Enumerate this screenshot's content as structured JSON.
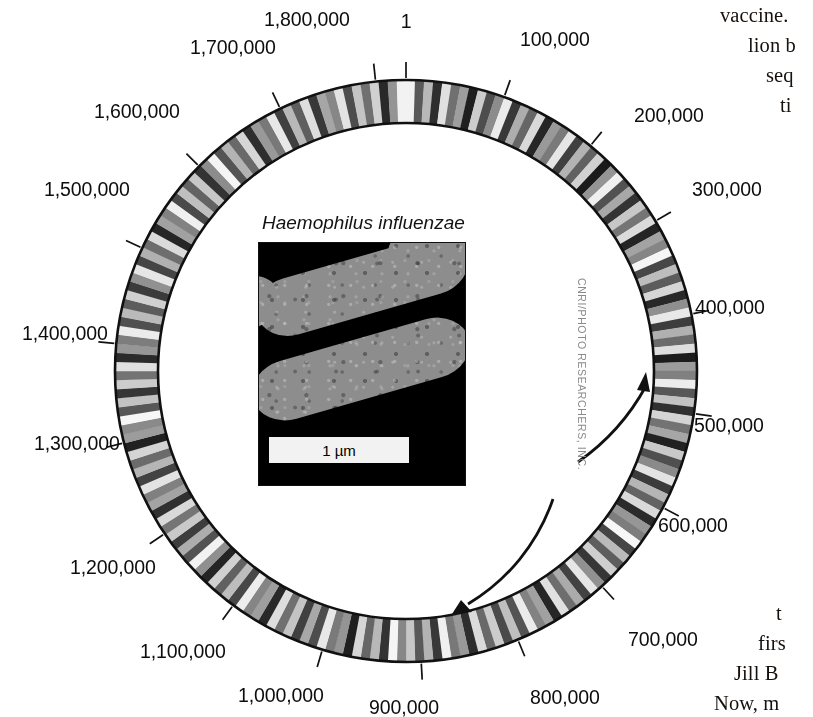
{
  "figure": {
    "kind": "circular-genome-map",
    "organism_label": "Haemophilus influenzae",
    "scale_bar_label": "1 µm",
    "photo_credit": "CNRI/PHOTO RESEARCHERS, INC.",
    "genome_length_bp": 1830000,
    "ring": {
      "outer_radius": 291,
      "inner_radius": 248,
      "center_x": 406,
      "center_y": 371,
      "stroke": "#111111",
      "band_colors": [
        "#ffffff",
        "#d8d8d8",
        "#b4b4b4",
        "#8e8e8e",
        "#6a6a6a",
        "#4a4a4a"
      ]
    },
    "arrows": {
      "outer_label": "replication-direction-clockwise",
      "inner_label": "replication-direction-counterclockwise",
      "color": "#111111"
    }
  },
  "ticks": [
    {
      "value": "1",
      "angle_deg": 0,
      "x": 406,
      "y": 10,
      "align": "center",
      "leader": "vertical"
    },
    {
      "value": "100,000",
      "angle_deg": 19.7,
      "x": 520,
      "y": 28,
      "align": "left",
      "leader": "diagonal"
    },
    {
      "value": "200,000",
      "angle_deg": 39.3,
      "x": 634,
      "y": 104,
      "align": "left",
      "leader": "diagonal"
    },
    {
      "value": "300,000",
      "angle_deg": 59,
      "x": 692,
      "y": 178,
      "align": "left",
      "leader": "diagonal"
    },
    {
      "value": "400,000",
      "angle_deg": 78.7,
      "x": 695,
      "y": 296,
      "align": "left",
      "leader": "diagonal"
    },
    {
      "value": "500,000",
      "angle_deg": 98.4,
      "x": 694,
      "y": 414,
      "align": "left",
      "leader": "diagonal"
    },
    {
      "value": "600,000",
      "angle_deg": 118,
      "x": 658,
      "y": 514,
      "align": "left",
      "leader": "diagonal"
    },
    {
      "value": "700,000",
      "angle_deg": 137.7,
      "x": 628,
      "y": 628,
      "align": "left",
      "leader": "diagonal"
    },
    {
      "value": "800,000",
      "angle_deg": 157.4,
      "x": 530,
      "y": 686,
      "align": "left",
      "leader": "diagonal"
    },
    {
      "value": "900,000",
      "angle_deg": 177,
      "x": 404,
      "y": 696,
      "align": "center",
      "leader": "vertical"
    },
    {
      "value": "1,000,000",
      "angle_deg": 196.7,
      "x": 238,
      "y": 684,
      "align": "left",
      "leader": "diagonal"
    },
    {
      "value": "1,100,000",
      "angle_deg": 216.4,
      "x": 140,
      "y": 640,
      "align": "left",
      "leader": "diagonal"
    },
    {
      "value": "1,200,000",
      "angle_deg": 236,
      "x": 70,
      "y": 556,
      "align": "left",
      "leader": "diagonal"
    },
    {
      "value": "1,300,000",
      "angle_deg": 255.7,
      "x": 34,
      "y": 432,
      "align": "left",
      "leader": "diagonal"
    },
    {
      "value": "1,400,000",
      "angle_deg": 275.4,
      "x": 22,
      "y": 322,
      "align": "left",
      "leader": "diagonal"
    },
    {
      "value": "1,500,000",
      "angle_deg": 295,
      "x": 44,
      "y": 178,
      "align": "left",
      "leader": "diagonal"
    },
    {
      "value": "1,600,000",
      "angle_deg": 314.7,
      "x": 94,
      "y": 100,
      "align": "left",
      "leader": "diagonal"
    },
    {
      "value": "1,700,000",
      "angle_deg": 334.4,
      "x": 190,
      "y": 36,
      "align": "left",
      "leader": "diagonal"
    },
    {
      "value": "1,800,000",
      "angle_deg": 354,
      "x": 264,
      "y": 8,
      "align": "left",
      "leader": "vertical"
    }
  ],
  "surrounding_text": {
    "top_right": [
      {
        "text": "vaccine.",
        "x": 720,
        "y": 4
      },
      {
        "text": "lion b",
        "x": 748,
        "y": 34
      },
      {
        "text": "seq",
        "x": 766,
        "y": 64
      },
      {
        "text": "ti",
        "x": 780,
        "y": 94
      }
    ],
    "bottom_right": [
      {
        "text": "t",
        "x": 776,
        "y": 602
      },
      {
        "text": "firs",
        "x": 758,
        "y": 632
      },
      {
        "text": "Jill B",
        "x": 734,
        "y": 662
      },
      {
        "text": "Now, m",
        "x": 714,
        "y": 692
      }
    ]
  },
  "chart_data": {
    "type": "circular-ideogram",
    "units": "base pairs",
    "axis_range": [
      1,
      1830000
    ],
    "tick_interval": 100000,
    "tick_labels": [
      "1",
      "100,000",
      "200,000",
      "300,000",
      "400,000",
      "500,000",
      "600,000",
      "700,000",
      "800,000",
      "900,000",
      "1,000,000",
      "1,100,000",
      "1,200,000",
      "1,300,000",
      "1,400,000",
      "1,500,000",
      "1,600,000",
      "1,700,000",
      "1,800,000"
    ],
    "grid": false,
    "legend": "none",
    "band_intensities": [
      0.95,
      0.35,
      0.72,
      0.18,
      0.88,
      0.44,
      0.62,
      0.12,
      0.8,
      0.3,
      0.55,
      0.92,
      0.22,
      0.68,
      0.4,
      0.85,
      0.15,
      0.6,
      0.48,
      0.9,
      0.25,
      0.7,
      0.38,
      0.82,
      0.1,
      0.58,
      0.94,
      0.32,
      0.66,
      0.2,
      0.78,
      0.46,
      0.86,
      0.14,
      0.64,
      0.52,
      0.96,
      0.28,
      0.74,
      0.36,
      0.84,
      0.16,
      0.56,
      0.91,
      0.24,
      0.69,
      0.42,
      0.87,
      0.11,
      0.61,
      0.5,
      0.93,
      0.34,
      0.76,
      0.19,
      0.83,
      0.45,
      0.65,
      0.13,
      0.79,
      0.31,
      0.54,
      0.89,
      0.23,
      0.71,
      0.39,
      0.85,
      0.17,
      0.59,
      0.49,
      0.97,
      0.27,
      0.73,
      0.37,
      0.81,
      0.21,
      0.57,
      0.9,
      0.26,
      0.67,
      0.43,
      0.88,
      0.15,
      0.63,
      0.51,
      0.92,
      0.33,
      0.75,
      0.29,
      0.8,
      0.41,
      0.86,
      0.18,
      0.6,
      0.47,
      0.94,
      0.22,
      0.7,
      0.35,
      0.78,
      0.53,
      0.96,
      0.2,
      0.72,
      0.4,
      0.84,
      0.12,
      0.58,
      0.48,
      0.91,
      0.3,
      0.66,
      0.25,
      0.77,
      0.44,
      0.87,
      0.16,
      0.62,
      0.52,
      0.93,
      0.28,
      0.74,
      0.38,
      0.82,
      0.14,
      0.56,
      0.95,
      0.32,
      0.68,
      0.24,
      0.79,
      0.46,
      0.85,
      0.19,
      0.64,
      0.5,
      0.89,
      0.26,
      0.71,
      0.42,
      0.83,
      0.13,
      0.61,
      0.54,
      0.97,
      0.34,
      0.76,
      0.21,
      0.8,
      0.45,
      0.88,
      0.17,
      0.59,
      0.49,
      0.92,
      0.31,
      0.73,
      0.36,
      0.81,
      0.23,
      0.57,
      0.9,
      0.27,
      0.69,
      0.43,
      0.86,
      0.15,
      0.63,
      0.51,
      0.94,
      0.29,
      0.75,
      0.39,
      0.78,
      0.2,
      0.55,
      0.96,
      0.33,
      0.7,
      0.41,
      0.84,
      0.18,
      0.6,
      0.47,
      0.91,
      0.25,
      0.72,
      0.37,
      0.87,
      0.22,
      0.65,
      0.53,
      0.89,
      0.3,
      0.77,
      0.44,
      0.82,
      0.16,
      0.58,
      0.95
    ]
  }
}
